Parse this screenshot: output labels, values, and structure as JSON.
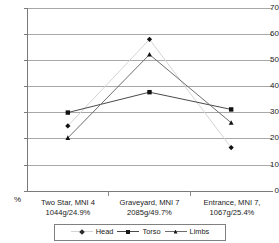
{
  "chart_data": {
    "type": "line",
    "title": "",
    "xlabel": "",
    "ylabel": "%",
    "ylim": [
      0,
      70
    ],
    "ytick_step": 10,
    "yticks": [
      70,
      60,
      50,
      40,
      30,
      20,
      10,
      0
    ],
    "grid": true,
    "legend_position": "bottom",
    "categories": [
      "Two Star, MNI 4 1044g/24.9%",
      "Graveyard, MNI 7 2085g/49.7%",
      "Entrance, MNI 7, 1067g/25.4%"
    ],
    "series": [
      {
        "name": "Head",
        "values": [
          24.9,
          58.0,
          16.6
        ],
        "color": "#d4d4d4",
        "marker": "diamond"
      },
      {
        "name": "Torso",
        "values": [
          30.0,
          37.8,
          31.2
        ],
        "color": "#4a4a4a",
        "marker": "square"
      },
      {
        "name": "Limbs",
        "values": [
          20.3,
          52.2,
          26.1
        ],
        "color": "#6e6e6e",
        "marker": "triangle"
      }
    ]
  },
  "axes": {
    "y_unit_label": "%",
    "y_tick_labels": [
      "70",
      "60",
      "50",
      "40",
      "30",
      "20",
      "10",
      "0"
    ],
    "x_categories": [
      {
        "line1": "Two Star, MNI 4",
        "line2": "1044g/24.9%"
      },
      {
        "line1": "Graveyard, MNI 7",
        "line2": "2085g/49.7%"
      },
      {
        "line1": "Entrance, MNI 7,",
        "line2": "1067g/25.4%"
      }
    ]
  },
  "legend": {
    "items": [
      {
        "label": "Head",
        "color": "#d4d4d4",
        "marker": "diamond"
      },
      {
        "label": "Torso",
        "color": "#4a4a4a",
        "marker": "square"
      },
      {
        "label": "Limbs",
        "color": "#6e6e6e",
        "marker": "triangle"
      }
    ]
  }
}
